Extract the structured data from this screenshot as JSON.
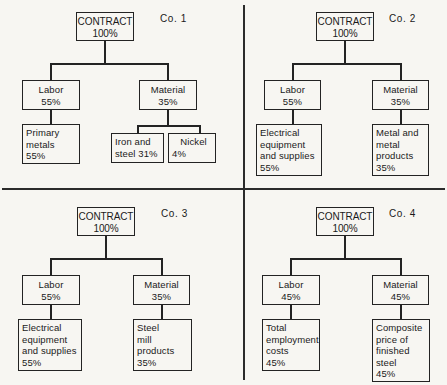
{
  "figure": {
    "type": "org-chart-grid",
    "background_color": "#f7f6f2",
    "line_color": "#232323",
    "grid": {
      "rows": 2,
      "cols": 2,
      "divider_x": 243,
      "divider_y": 188
    }
  },
  "quadrants": [
    {
      "id": "co-1",
      "caption": "Co. 1",
      "root": {
        "name": "CONTRACT",
        "value": "100%"
      },
      "branches": [
        {
          "name": "Labor",
          "value": "55%",
          "children": [
            {
              "lines": [
                "Primary",
                "metals",
                "55%"
              ],
              "name": "Primary metals",
              "value": "55%"
            }
          ]
        },
        {
          "name": "Material",
          "value": "35%",
          "children": [
            {
              "lines": [
                "Iron and",
                "steel 31%"
              ],
              "name": "Iron and steel",
              "value": "31%"
            },
            {
              "lines": [
                "Nickel",
                "4%"
              ],
              "name": "Nickel",
              "value": "4%"
            }
          ]
        }
      ]
    },
    {
      "id": "co-2",
      "caption": "Co. 2",
      "root": {
        "name": "CONTRACT",
        "value": "100%"
      },
      "branches": [
        {
          "name": "Labor",
          "value": "55%",
          "children": [
            {
              "lines": [
                "Electrical",
                "equipment",
                "and supplies",
                "55%"
              ],
              "name": "Electrical equipment and supplies",
              "value": "55%"
            }
          ]
        },
        {
          "name": "Material",
          "value": "35%",
          "children": [
            {
              "lines": [
                "Metal and",
                "metal",
                "products",
                "35%"
              ],
              "name": "Metal and metal products",
              "value": "35%"
            }
          ]
        }
      ]
    },
    {
      "id": "co-3",
      "caption": "Co. 3",
      "root": {
        "name": "CONTRACT",
        "value": "100%"
      },
      "branches": [
        {
          "name": "Labor",
          "value": "55%",
          "children": [
            {
              "lines": [
                "Electrical",
                "equipment",
                "and supplies",
                "55%"
              ],
              "name": "Electrical equipment and supplies",
              "value": "55%"
            }
          ]
        },
        {
          "name": "Material",
          "value": "35%",
          "children": [
            {
              "lines": [
                "Steel",
                "mill",
                "products",
                "35%"
              ],
              "name": "Steel mill products",
              "value": "35%"
            }
          ]
        }
      ]
    },
    {
      "id": "co-4",
      "caption": "Co. 4",
      "root": {
        "name": "CONTRACT",
        "value": "100%"
      },
      "branches": [
        {
          "name": "Labor",
          "value": "45%",
          "children": [
            {
              "lines": [
                "Total",
                "employment",
                "costs",
                "45%"
              ],
              "name": "Total employment costs",
              "value": "45%"
            }
          ]
        },
        {
          "name": "Material",
          "value": "45%",
          "children": [
            {
              "lines": [
                "Composite",
                "price of",
                "finished",
                "steel",
                "45%"
              ],
              "name": "Composite price of finished steel",
              "value": "45%"
            }
          ]
        }
      ]
    }
  ],
  "q1": {
    "caption": "Co. 1",
    "root_name": "CONTRACT",
    "root_value": "100%",
    "labor_name": "Labor",
    "labor_value": "55%",
    "material_name": "Material",
    "material_value": "35%",
    "labor_child": {
      "l1": "Primary",
      "l2": "metals",
      "l3": "55%"
    },
    "mat_child_a": {
      "l1": "Iron and",
      "l2": "steel 31%"
    },
    "mat_child_b": {
      "l1": "Nickel",
      "l2": "4%"
    }
  },
  "q2": {
    "caption": "Co. 2",
    "root_name": "CONTRACT",
    "root_value": "100%",
    "labor_name": "Labor",
    "labor_value": "55%",
    "material_name": "Material",
    "material_value": "35%",
    "labor_child": {
      "l1": "Electrical",
      "l2": "equipment",
      "l3": "and supplies",
      "l4": "55%"
    },
    "mat_child": {
      "l1": "Metal and",
      "l2": "metal",
      "l3": "products",
      "l4": "35%"
    }
  },
  "q3": {
    "caption": "Co. 3",
    "root_name": "CONTRACT",
    "root_value": "100%",
    "labor_name": "Labor",
    "labor_value": "55%",
    "material_name": "Material",
    "material_value": "35%",
    "labor_child": {
      "l1": "Electrical",
      "l2": "equipment",
      "l3": "and supplies",
      "l4": "55%"
    },
    "mat_child": {
      "l1": "Steel",
      "l2": "mill",
      "l3": "products",
      "l4": "35%"
    }
  },
  "q4": {
    "caption": "Co. 4",
    "root_name": "CONTRACT",
    "root_value": "100%",
    "labor_name": "Labor",
    "labor_value": "45%",
    "material_name": "Material",
    "material_value": "45%",
    "labor_child": {
      "l1": "Total",
      "l2": "employment",
      "l3": "costs",
      "l4": "45%"
    },
    "mat_child": {
      "l1": "Composite",
      "l2": "price of",
      "l3": "finished",
      "l4": "steel",
      "l5": "45%"
    }
  }
}
